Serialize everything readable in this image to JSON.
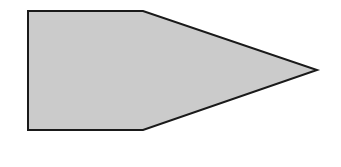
{
  "diagram": {
    "shape": "pentagon-arrow",
    "fill_color": "#cbcbcb",
    "stroke_color": "#1a1a1a",
    "stroke_width": 2,
    "points": "28,11 143,11 317,70 143,130 28,130"
  }
}
